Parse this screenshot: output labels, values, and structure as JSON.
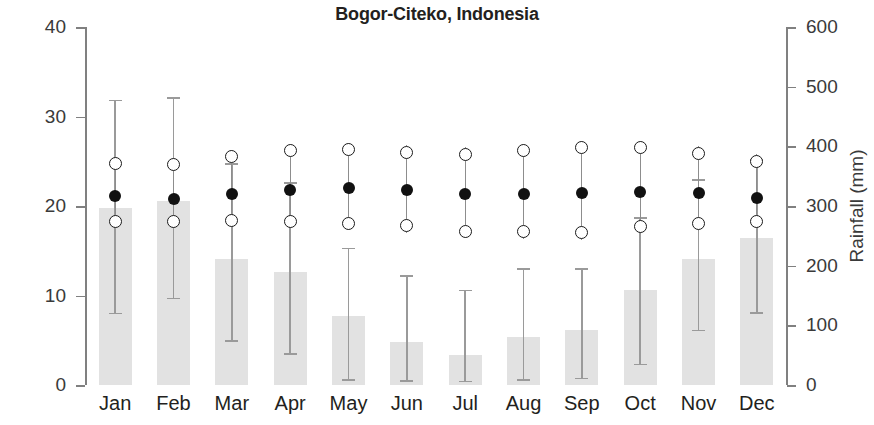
{
  "chart_data": {
    "type": "bar",
    "title": "Bogor-Citeko, Indonesia",
    "xlabel": "",
    "ylabel": "Temperature (°C)",
    "y2label": "Rainfall (mm)",
    "categories": [
      "Jan",
      "Feb",
      "Mar",
      "Apr",
      "May",
      "Jun",
      "Jul",
      "Aug",
      "Sep",
      "Oct",
      "Nov",
      "Dec"
    ],
    "ylim": [
      0,
      40
    ],
    "y2lim": [
      0,
      600
    ],
    "yticks": [
      "0",
      "10",
      "20",
      "30",
      "40"
    ],
    "ytick_values": [
      0,
      10,
      20,
      30,
      40
    ],
    "y2ticks": [
      "0",
      "100",
      "200",
      "300",
      "400",
      "500",
      "600"
    ],
    "y2tick_values": [
      0,
      100,
      200,
      300,
      400,
      500,
      600
    ],
    "grid": false,
    "legend": "none",
    "series": [
      {
        "name": "Rainfall",
        "axis": "right",
        "unit": "mm",
        "marker": "bar",
        "values": [
          297,
          308,
          211,
          189,
          116,
          72,
          51,
          80,
          93,
          159,
          211,
          247
        ],
        "err_high": [
          478,
          482,
          372,
          340,
          230,
          184,
          160,
          196,
          196,
          281,
          345,
          378
        ],
        "err_low": [
          121,
          146,
          75,
          53,
          10,
          8,
          7,
          10,
          12,
          36,
          93,
          122
        ]
      },
      {
        "name": "Maximum temperature",
        "axis": "left",
        "unit": "°C",
        "marker": "open-circle",
        "values": [
          24.7,
          24.6,
          25.5,
          26.2,
          26.3,
          26.0,
          25.8,
          26.2,
          26.5,
          26.5,
          25.9,
          25.0
        ]
      },
      {
        "name": "Mean temperature",
        "axis": "left",
        "unit": "°C",
        "marker": "filled-circle",
        "values": [
          21.1,
          20.8,
          21.3,
          21.8,
          22.0,
          21.8,
          21.3,
          21.3,
          21.4,
          21.6,
          21.4,
          20.9
        ]
      },
      {
        "name": "Minimum temperature",
        "axis": "left",
        "unit": "°C",
        "marker": "open-circle",
        "values": [
          18.3,
          18.3,
          18.4,
          18.3,
          18.1,
          17.8,
          17.2,
          17.1,
          17.0,
          17.7,
          18.0,
          18.3
        ]
      }
    ]
  }
}
